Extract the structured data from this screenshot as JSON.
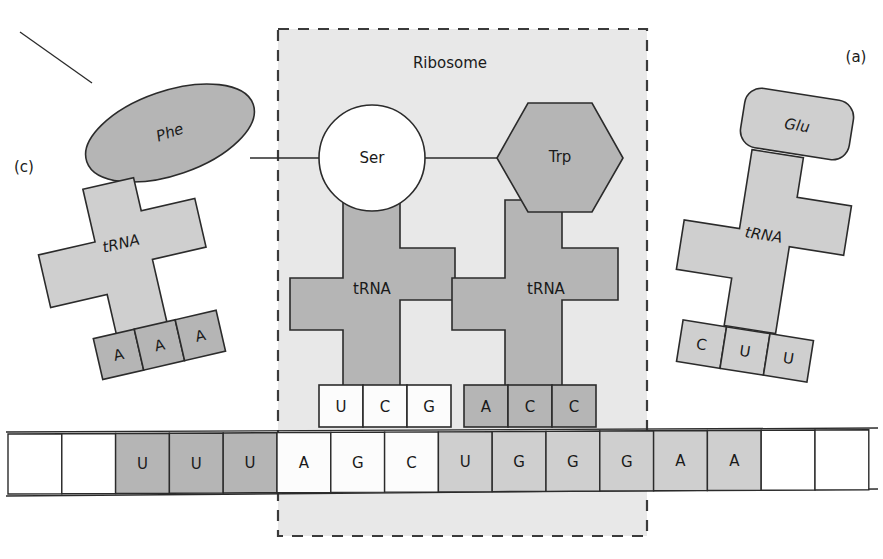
{
  "figure": {
    "title": "Ribosome",
    "panel_labels": {
      "left": "(c)",
      "right": "(a)"
    }
  },
  "ribosome": {
    "label": "Ribosome",
    "background_color": "#e8e8e8",
    "border_style": "dashed",
    "border_color": "#3a3a3a"
  },
  "amino_acids": {
    "phe": {
      "label": "Phe",
      "shape": "ellipse",
      "color": "#b5b5b5"
    },
    "ser": {
      "label": "Ser",
      "shape": "circle",
      "color": "#ffffff"
    },
    "trp": {
      "label": "Trp",
      "shape": "hexagon",
      "color": "#b5b5b5"
    },
    "glu": {
      "label": "Glu",
      "shape": "rounded-rect",
      "color": "#cfcfcf"
    }
  },
  "trnas": {
    "incoming_left": {
      "label": "tRNA",
      "panel": "(c)",
      "amino_acid": "Phe",
      "anticodon": [
        "A",
        "A",
        "A"
      ],
      "body_color": "#cfcfcf",
      "anticodon_color": "#b5b5b5"
    },
    "site_p": {
      "label": "tRNA",
      "amino_acid": "Ser",
      "anticodon": [
        "U",
        "C",
        "G"
      ],
      "body_color": "#b5b5b5",
      "anticodon_color": "#fcfcfc"
    },
    "site_a": {
      "label": "tRNA",
      "amino_acid": "Trp",
      "anticodon": [
        "A",
        "C",
        "C"
      ],
      "body_color": "#b5b5b5",
      "anticodon_color": "#b5b5b5"
    },
    "incoming_right": {
      "label": "tRNA",
      "panel": "(a)",
      "amino_acid": "Glu",
      "anticodon": [
        "C",
        "U",
        "U"
      ],
      "body_color": "#cfcfcf",
      "anticodon_color": "#cfcfcf"
    }
  },
  "mrna": {
    "bases": [
      {
        "base": "",
        "color": "#ffffff"
      },
      {
        "base": "",
        "color": "#ffffff"
      },
      {
        "base": "U",
        "color": "#b5b5b5"
      },
      {
        "base": "U",
        "color": "#b5b5b5"
      },
      {
        "base": "U",
        "color": "#b5b5b5"
      },
      {
        "base": "A",
        "color": "#fcfcfc"
      },
      {
        "base": "G",
        "color": "#fcfcfc"
      },
      {
        "base": "C",
        "color": "#fcfcfc"
      },
      {
        "base": "U",
        "color": "#cfcfcf"
      },
      {
        "base": "G",
        "color": "#cfcfcf"
      },
      {
        "base": "G",
        "color": "#cfcfcf"
      },
      {
        "base": "G",
        "color": "#cfcfcf"
      },
      {
        "base": "A",
        "color": "#cfcfcf"
      },
      {
        "base": "A",
        "color": "#cfcfcf"
      },
      {
        "base": "",
        "color": "#ffffff"
      },
      {
        "base": "",
        "color": "#ffffff"
      }
    ]
  }
}
